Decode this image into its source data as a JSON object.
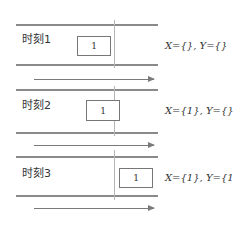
{
  "frames": [
    {
      "label": "时刻1",
      "box_value": "1",
      "sets": "X={}, Y={}"
    },
    {
      "label": "时刻2",
      "box_value": "1",
      "sets": "X={1}, Y={}"
    },
    {
      "label": "时刻3",
      "box_value": "1",
      "sets": "X={1}, Y={1}"
    }
  ],
  "colors": {
    "line": "#8a8a8a",
    "box_border": "#777777",
    "divider": "#b5b5b5"
  }
}
